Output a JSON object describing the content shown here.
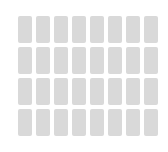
{
  "app": {
    "name": "placeholder-card-grid",
    "state_label": "loading",
    "background_color": "#ffffff",
    "canvas_width": 168,
    "canvas_height": 152
  },
  "grid": {
    "columns": 8,
    "rows": 4,
    "total_tiles": 32,
    "tile_width": 14,
    "tile_height": 27,
    "column_gap": 4,
    "row_gap": 4,
    "offset_left": 18,
    "offset_top": 16,
    "tile_color": "#d9d9d9",
    "tile_border_radius": 2,
    "tiles": [
      {
        "id": "r1c1",
        "row": 1,
        "column": 1,
        "label": ""
      },
      {
        "id": "r1c2",
        "row": 1,
        "column": 2,
        "label": ""
      },
      {
        "id": "r1c3",
        "row": 1,
        "column": 3,
        "label": ""
      },
      {
        "id": "r1c4",
        "row": 1,
        "column": 4,
        "label": ""
      },
      {
        "id": "r1c5",
        "row": 1,
        "column": 5,
        "label": ""
      },
      {
        "id": "r1c6",
        "row": 1,
        "column": 6,
        "label": ""
      },
      {
        "id": "r1c7",
        "row": 1,
        "column": 7,
        "label": ""
      },
      {
        "id": "r1c8",
        "row": 1,
        "column": 8,
        "label": ""
      },
      {
        "id": "r2c1",
        "row": 2,
        "column": 1,
        "label": ""
      },
      {
        "id": "r2c2",
        "row": 2,
        "column": 2,
        "label": ""
      },
      {
        "id": "r2c3",
        "row": 2,
        "column": 3,
        "label": ""
      },
      {
        "id": "r2c4",
        "row": 2,
        "column": 4,
        "label": ""
      },
      {
        "id": "r2c5",
        "row": 2,
        "column": 5,
        "label": ""
      },
      {
        "id": "r2c6",
        "row": 2,
        "column": 6,
        "label": ""
      },
      {
        "id": "r2c7",
        "row": 2,
        "column": 7,
        "label": ""
      },
      {
        "id": "r2c8",
        "row": 2,
        "column": 8,
        "label": ""
      },
      {
        "id": "r3c1",
        "row": 3,
        "column": 1,
        "label": ""
      },
      {
        "id": "r3c2",
        "row": 3,
        "column": 2,
        "label": ""
      },
      {
        "id": "r3c3",
        "row": 3,
        "column": 3,
        "label": ""
      },
      {
        "id": "r3c4",
        "row": 3,
        "column": 4,
        "label": ""
      },
      {
        "id": "r3c5",
        "row": 3,
        "column": 5,
        "label": ""
      },
      {
        "id": "r3c6",
        "row": 3,
        "column": 6,
        "label": ""
      },
      {
        "id": "r3c7",
        "row": 3,
        "column": 7,
        "label": ""
      },
      {
        "id": "r3c8",
        "row": 3,
        "column": 8,
        "label": ""
      },
      {
        "id": "r4c1",
        "row": 4,
        "column": 1,
        "label": ""
      },
      {
        "id": "r4c2",
        "row": 4,
        "column": 2,
        "label": ""
      },
      {
        "id": "r4c3",
        "row": 4,
        "column": 3,
        "label": ""
      },
      {
        "id": "r4c4",
        "row": 4,
        "column": 4,
        "label": ""
      },
      {
        "id": "r4c5",
        "row": 4,
        "column": 5,
        "label": ""
      },
      {
        "id": "r4c6",
        "row": 4,
        "column": 6,
        "label": ""
      },
      {
        "id": "r4c7",
        "row": 4,
        "column": 7,
        "label": ""
      },
      {
        "id": "r4c8",
        "row": 4,
        "column": 8,
        "label": ""
      }
    ]
  }
}
